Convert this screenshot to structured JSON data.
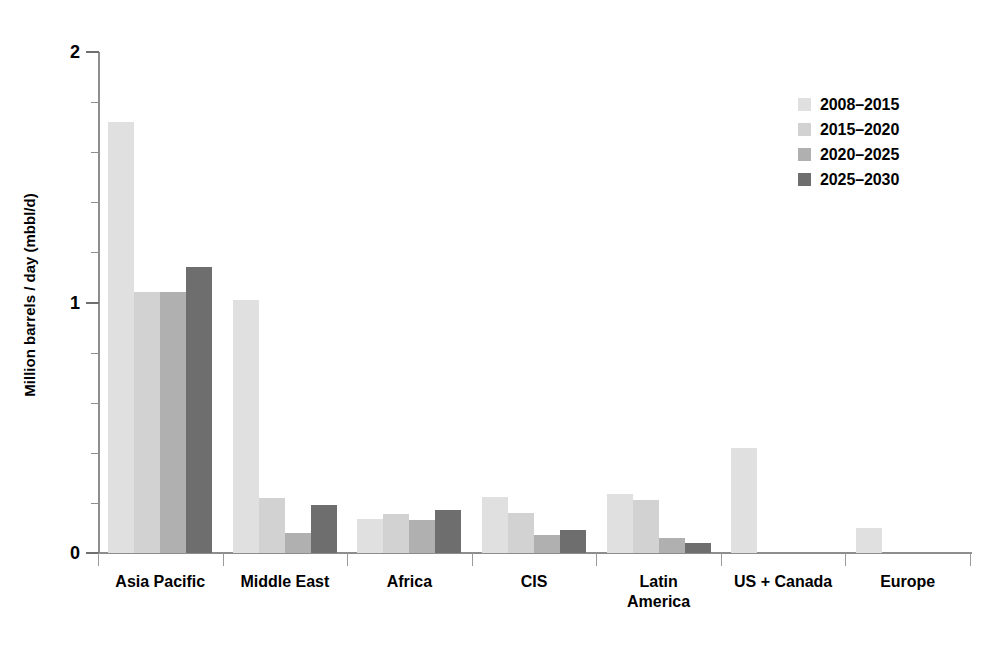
{
  "chart_data": {
    "type": "bar",
    "title": "",
    "subtitle": "",
    "xlabel": "",
    "ylabel": "Million barrels / day (mbbl/d)",
    "ylim": [
      0,
      2
    ],
    "y_ticks_major": [
      "0",
      "1",
      "2"
    ],
    "y_tick_major_values": [
      0,
      1,
      2
    ],
    "y_tick_minor_values": [
      0.2,
      0.4,
      0.6,
      0.8,
      1.2,
      1.4,
      1.6,
      1.8
    ],
    "grid": false,
    "legend_position": "top-right",
    "categories": [
      "Asia Pacific",
      "Middle East",
      "Africa",
      "CIS",
      "Latin\nAmerica",
      "US + Canada",
      "Europe"
    ],
    "series": [
      {
        "name": "2008–2015",
        "color": "#e0e0e0",
        "values": [
          1.72,
          1.01,
          0.135,
          0.225,
          0.235,
          0.42,
          0.1
        ]
      },
      {
        "name": "2015–2020",
        "color": "#d2d2d2",
        "values": [
          1.04,
          0.22,
          0.155,
          0.16,
          0.21,
          0.0,
          0.0
        ]
      },
      {
        "name": "2020–2025",
        "color": "#b0b0b0",
        "values": [
          1.04,
          0.08,
          0.13,
          0.07,
          0.06,
          0.0,
          0.0
        ]
      },
      {
        "name": "2025–2030",
        "color": "#6e6e6e",
        "values": [
          1.14,
          0.19,
          0.17,
          0.09,
          0.04,
          0.0,
          0.0
        ]
      }
    ]
  },
  "legend": {
    "items": [
      {
        "label": "2008–2015",
        "color": "#e0e0e0"
      },
      {
        "label": "2015–2020",
        "color": "#d2d2d2"
      },
      {
        "label": "2020–2025",
        "color": "#b0b0b0"
      },
      {
        "label": "2025–2030",
        "color": "#6e6e6e"
      }
    ]
  },
  "axis": {
    "y_title": "Million barrels / day (mbbl/d)",
    "y_labels": [
      "2",
      "1",
      "0"
    ]
  }
}
